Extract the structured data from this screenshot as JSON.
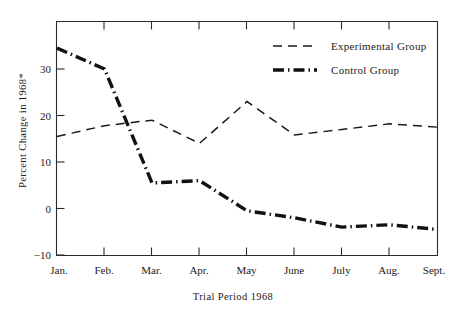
{
  "chart_data": {
    "type": "line",
    "title": "",
    "xlabel": "Trial Period  1968",
    "ylabel": "Percent Change in 1968*",
    "categories": [
      "Jan.",
      "Feb.",
      "Mar.",
      "Apr.",
      "May",
      "June",
      "July",
      "Aug.",
      "Sept."
    ],
    "ylim": [
      -10,
      38
    ],
    "yticks": [
      30,
      20,
      10,
      0,
      -10
    ],
    "ytick_labels": [
      "30",
      "20",
      "10",
      "0",
      "−10"
    ],
    "grid": false,
    "legend_position": "top-right",
    "series": [
      {
        "name": "Experimental Group",
        "style": "dashed",
        "values": [
          15.5,
          17.8,
          19.0,
          14.0,
          23.0,
          15.8,
          17.0,
          18.2,
          17.5
        ]
      },
      {
        "name": "Control Group",
        "style": "dash-dot-bold",
        "values": [
          34.5,
          30.0,
          5.5,
          6.0,
          -0.5,
          -2.0,
          -4.0,
          -3.5,
          -4.5
        ]
      }
    ],
    "legend": [
      {
        "label": "Experimental Group"
      },
      {
        "label": "Control Group"
      }
    ],
    "colors": {
      "experimental": "#1a1a1a",
      "control": "#111111",
      "axis": "#2a2a2a",
      "background": "#ffffff"
    }
  }
}
